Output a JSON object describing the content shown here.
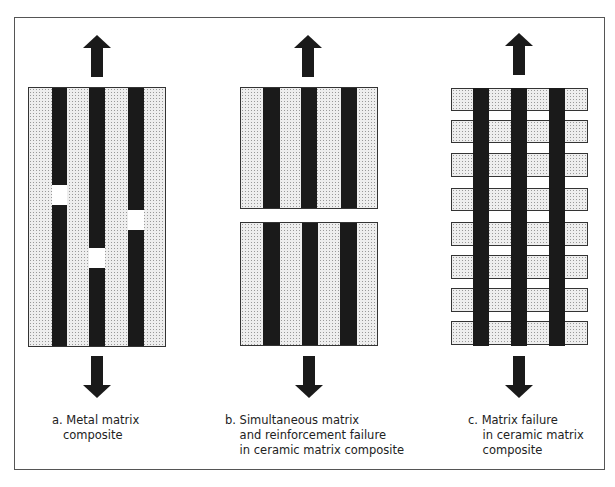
{
  "figure": {
    "panels": [
      {
        "id": "a",
        "caption_line1": "a. Metal matrix",
        "caption_line2": "   composite",
        "caption_line3": ""
      },
      {
        "id": "b",
        "caption_line1": "b. Simultaneous matrix",
        "caption_line2": "    and reinforcement failure",
        "caption_line3": "    in ceramic matrix composite"
      },
      {
        "id": "c",
        "caption_line1": "c. Matrix failure",
        "caption_line2": "    in ceramic matrix",
        "caption_line3": "    composite"
      }
    ],
    "colors": {
      "fiber": "#1a1a1a",
      "matrix": "#eeeeee",
      "border": "#555555"
    }
  }
}
